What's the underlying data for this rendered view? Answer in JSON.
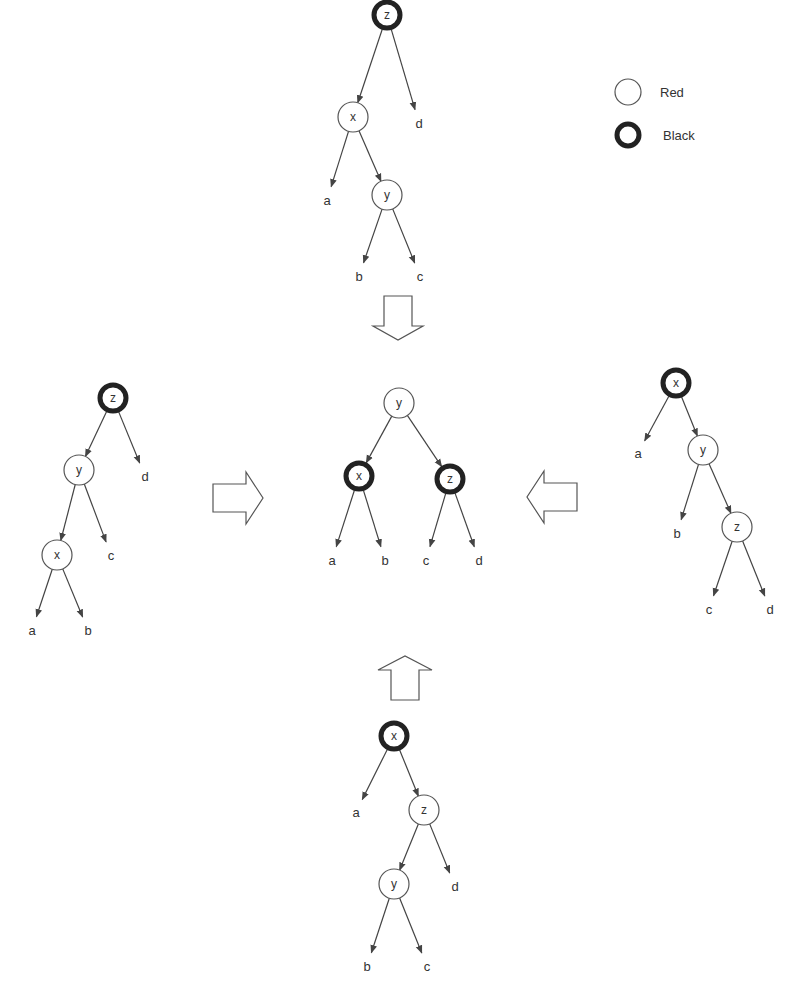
{
  "legend": {
    "items": [
      {
        "label": "Red",
        "type": "red"
      },
      {
        "label": "Black",
        "type": "black"
      }
    ]
  },
  "trees": [
    {
      "id": "top",
      "nodes": [
        {
          "id": "t-z",
          "label": "z",
          "color": "black",
          "x": 387,
          "y": 15
        },
        {
          "id": "t-x",
          "label": "x",
          "color": "red",
          "x": 353,
          "y": 117
        },
        {
          "id": "t-y",
          "label": "y",
          "color": "red",
          "x": 387,
          "y": 195
        }
      ],
      "leaves": [
        {
          "id": "t-a",
          "label": "a",
          "x": 327,
          "y": 200
        },
        {
          "id": "t-d",
          "label": "d",
          "x": 419,
          "y": 123
        },
        {
          "id": "t-b",
          "label": "b",
          "x": 359,
          "y": 276
        },
        {
          "id": "t-c",
          "label": "c",
          "x": 420,
          "y": 276
        }
      ],
      "edges": [
        {
          "from": "t-z",
          "to": "t-x"
        },
        {
          "from": "t-z",
          "to": "t-d"
        },
        {
          "from": "t-x",
          "to": "t-a"
        },
        {
          "from": "t-x",
          "to": "t-y"
        },
        {
          "from": "t-y",
          "to": "t-b"
        },
        {
          "from": "t-y",
          "to": "t-c"
        }
      ]
    },
    {
      "id": "left",
      "nodes": [
        {
          "id": "l-z",
          "label": "z",
          "color": "black",
          "x": 113,
          "y": 398
        },
        {
          "id": "l-y",
          "label": "y",
          "color": "red",
          "x": 79,
          "y": 470
        },
        {
          "id": "l-x",
          "label": "x",
          "color": "red",
          "x": 57,
          "y": 555
        }
      ],
      "leaves": [
        {
          "id": "l-d",
          "label": "d",
          "x": 145,
          "y": 476
        },
        {
          "id": "l-c",
          "label": "c",
          "x": 111,
          "y": 555
        },
        {
          "id": "l-a",
          "label": "a",
          "x": 32,
          "y": 630
        },
        {
          "id": "l-b",
          "label": "b",
          "x": 88,
          "y": 630
        }
      ],
      "edges": [
        {
          "from": "l-z",
          "to": "l-y"
        },
        {
          "from": "l-z",
          "to": "l-d"
        },
        {
          "from": "l-y",
          "to": "l-x"
        },
        {
          "from": "l-y",
          "to": "l-c"
        },
        {
          "from": "l-x",
          "to": "l-a"
        },
        {
          "from": "l-x",
          "to": "l-b"
        }
      ]
    },
    {
      "id": "center",
      "nodes": [
        {
          "id": "c-y",
          "label": "y",
          "color": "red",
          "x": 399,
          "y": 403
        },
        {
          "id": "c-x",
          "label": "x",
          "color": "black",
          "x": 359,
          "y": 476
        },
        {
          "id": "c-z",
          "label": "z",
          "color": "black",
          "x": 450,
          "y": 479
        }
      ],
      "leaves": [
        {
          "id": "c-a",
          "label": "a",
          "x": 332,
          "y": 560
        },
        {
          "id": "c-b",
          "label": "b",
          "x": 385,
          "y": 560
        },
        {
          "id": "c-c",
          "label": "c",
          "x": 426,
          "y": 560
        },
        {
          "id": "c-d",
          "label": "d",
          "x": 479,
          "y": 560
        }
      ],
      "edges": [
        {
          "from": "c-y",
          "to": "c-x"
        },
        {
          "from": "c-y",
          "to": "c-z"
        },
        {
          "from": "c-x",
          "to": "c-a"
        },
        {
          "from": "c-x",
          "to": "c-b"
        },
        {
          "from": "c-z",
          "to": "c-c"
        },
        {
          "from": "c-z",
          "to": "c-d"
        }
      ]
    },
    {
      "id": "right",
      "nodes": [
        {
          "id": "r-x",
          "label": "x",
          "color": "black",
          "x": 676,
          "y": 383
        },
        {
          "id": "r-y",
          "label": "y",
          "color": "red",
          "x": 703,
          "y": 450
        },
        {
          "id": "r-z",
          "label": "z",
          "color": "red",
          "x": 737,
          "y": 527
        }
      ],
      "leaves": [
        {
          "id": "r-a",
          "label": "a",
          "x": 638,
          "y": 453
        },
        {
          "id": "r-b",
          "label": "b",
          "x": 677,
          "y": 533
        },
        {
          "id": "r-c",
          "label": "c",
          "x": 709,
          "y": 609
        },
        {
          "id": "r-d",
          "label": "d",
          "x": 770,
          "y": 609
        }
      ],
      "edges": [
        {
          "from": "r-x",
          "to": "r-a"
        },
        {
          "from": "r-x",
          "to": "r-y"
        },
        {
          "from": "r-y",
          "to": "r-b"
        },
        {
          "from": "r-y",
          "to": "r-z"
        },
        {
          "from": "r-z",
          "to": "r-c"
        },
        {
          "from": "r-z",
          "to": "r-d"
        }
      ]
    },
    {
      "id": "bottom",
      "nodes": [
        {
          "id": "b-x",
          "label": "x",
          "color": "black",
          "x": 394,
          "y": 736
        },
        {
          "id": "b-z",
          "label": "z",
          "color": "red",
          "x": 424,
          "y": 810
        },
        {
          "id": "b-y",
          "label": "y",
          "color": "red",
          "x": 394,
          "y": 884
        }
      ],
      "leaves": [
        {
          "id": "b-a",
          "label": "a",
          "x": 356,
          "y": 812
        },
        {
          "id": "b-d",
          "label": "d",
          "x": 455,
          "y": 886
        },
        {
          "id": "b-b",
          "label": "b",
          "x": 367,
          "y": 966
        },
        {
          "id": "b-c",
          "label": "c",
          "x": 427,
          "y": 966
        }
      ],
      "edges": [
        {
          "from": "b-x",
          "to": "b-a"
        },
        {
          "from": "b-x",
          "to": "b-z"
        },
        {
          "from": "b-z",
          "to": "b-y"
        },
        {
          "from": "b-z",
          "to": "b-d"
        },
        {
          "from": "b-y",
          "to": "b-b"
        },
        {
          "from": "b-y",
          "to": "b-c"
        }
      ]
    }
  ],
  "transform_arrows": [
    {
      "id": "arrow-down",
      "direction": "down",
      "x": 398,
      "y": 318
    },
    {
      "id": "arrow-right",
      "direction": "right",
      "x": 238,
      "y": 498
    },
    {
      "id": "arrow-left",
      "direction": "left",
      "x": 552,
      "y": 497
    },
    {
      "id": "arrow-up",
      "direction": "up",
      "x": 405,
      "y": 678
    }
  ]
}
